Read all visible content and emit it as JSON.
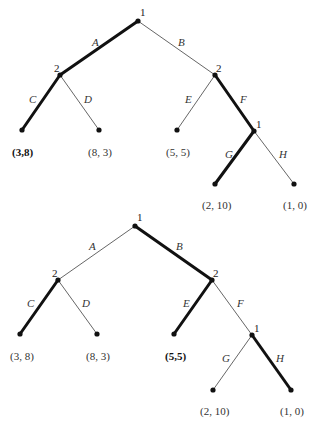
{
  "diagrams": [
    {
      "name": "tree-top",
      "nodes": {
        "root": {
          "player": "1",
          "x": 138,
          "y": 21
        },
        "left": {
          "player": "2",
          "x": 60,
          "y": 75
        },
        "right": {
          "player": "2",
          "x": 215,
          "y": 75
        },
        "sub": {
          "player": "1",
          "x": 254,
          "y": 131
        }
      },
      "edges": [
        {
          "label": "A",
          "bold": true
        },
        {
          "label": "B",
          "bold": false
        },
        {
          "label": "C",
          "bold": true
        },
        {
          "label": "D",
          "bold": false
        },
        {
          "label": "E",
          "bold": false
        },
        {
          "label": "F",
          "bold": true
        },
        {
          "label": "G",
          "bold": true
        },
        {
          "label": "H",
          "bold": false
        }
      ],
      "payoffs": [
        {
          "text": "(3,8)",
          "bold": true
        },
        {
          "text": "(8, 3)",
          "bold": false
        },
        {
          "text": "(5, 5)",
          "bold": false
        },
        {
          "text": "(2, 10)",
          "bold": false
        },
        {
          "text": "(1, 0)",
          "bold": false
        }
      ]
    },
    {
      "name": "tree-bottom",
      "nodes": {
        "root": {
          "player": "1",
          "x": 135,
          "y": 226
        },
        "left": {
          "player": "2",
          "x": 58,
          "y": 280
        },
        "right": {
          "player": "2",
          "x": 212,
          "y": 280
        },
        "sub": {
          "player": "1",
          "x": 252,
          "y": 335
        }
      },
      "edges": [
        {
          "label": "A",
          "bold": false
        },
        {
          "label": "B",
          "bold": true
        },
        {
          "label": "C",
          "bold": true
        },
        {
          "label": "D",
          "bold": false
        },
        {
          "label": "E",
          "bold": true
        },
        {
          "label": "F",
          "bold": false
        },
        {
          "label": "G",
          "bold": false
        },
        {
          "label": "H",
          "bold": true
        }
      ],
      "payoffs": [
        {
          "text": "(3, 8)",
          "bold": false
        },
        {
          "text": "(8, 3)",
          "bold": false
        },
        {
          "text": "(5,5)",
          "bold": true
        },
        {
          "text": "(2, 10)",
          "bold": false
        },
        {
          "text": "(1, 0)",
          "bold": false
        }
      ]
    }
  ]
}
